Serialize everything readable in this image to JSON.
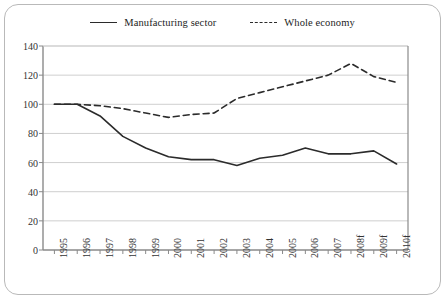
{
  "legend": {
    "items": [
      {
        "label": "Manufacturing sector",
        "style": "solid",
        "color": "#2b2b2b"
      },
      {
        "label": "Whole economy",
        "style": "dashed",
        "color": "#2b2b2b"
      }
    ]
  },
  "chart_data": {
    "type": "line",
    "title": "",
    "subtitle": "",
    "xlabel": "",
    "ylabel": "",
    "categories": [
      "1995",
      "1996",
      "1997",
      "1998",
      "1999",
      "2000",
      "2001",
      "2002",
      "2003",
      "2004",
      "2005",
      "2006",
      "2007",
      "2008f",
      "2009f",
      "2010f"
    ],
    "series": [
      {
        "name": "Manufacturing sector",
        "style": "solid",
        "color": "#2b2b2b",
        "values": [
          100,
          100,
          92,
          78,
          70,
          64,
          62,
          62,
          58,
          63,
          65,
          70,
          66,
          66,
          68,
          59
        ]
      },
      {
        "name": "Whole economy",
        "style": "dashed",
        "color": "#2b2b2b",
        "values": [
          100,
          100,
          99,
          97,
          94,
          91,
          93,
          94,
          104,
          108,
          112,
          116,
          120,
          128,
          119,
          115
        ]
      }
    ],
    "ylim": [
      0,
      140
    ],
    "yticks": [
      0,
      20,
      40,
      60,
      80,
      100,
      120,
      140
    ],
    "grid": true,
    "legend_position": "top-center",
    "xtick_rotation": -90
  },
  "axes": {
    "grid_color": "#cfcfcf",
    "axis_color": "#8a8a8a",
    "frame_color": "#b9b9b9",
    "background": "#ffffff"
  }
}
